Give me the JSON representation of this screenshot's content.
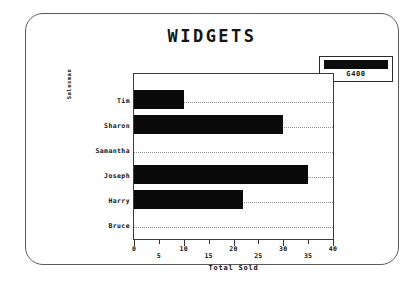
{
  "chart_data": {
    "type": "bar",
    "orientation": "horizontal",
    "title": "WIDGETS",
    "categories": [
      "Tim",
      "Sharon",
      "Samantha",
      "Joseph",
      "Harry",
      "Bruce"
    ],
    "values": [
      10,
      30,
      0,
      35,
      22,
      0
    ],
    "series": [
      {
        "name": "G400",
        "values": [
          10,
          30,
          0,
          35,
          22,
          0
        ],
        "color": "#0a0a0a"
      }
    ],
    "xlabel": "Total Sold",
    "ylabel": "Salesman",
    "xlim": [
      0,
      40
    ],
    "xticks": [
      0,
      5,
      10,
      15,
      20,
      25,
      30,
      35,
      40
    ],
    "xtick_labels": [
      "0",
      "5",
      "10",
      "15",
      "20",
      "25",
      "30",
      "35",
      "40"
    ],
    "grid": "horizontal-dotted",
    "legend_position": "top-right",
    "legend_entries": [
      "G400"
    ]
  },
  "legend": {
    "label": "G400",
    "swatch_color": "#0d0d0d"
  },
  "frame": {
    "border_color": "#5a5a5a"
  }
}
